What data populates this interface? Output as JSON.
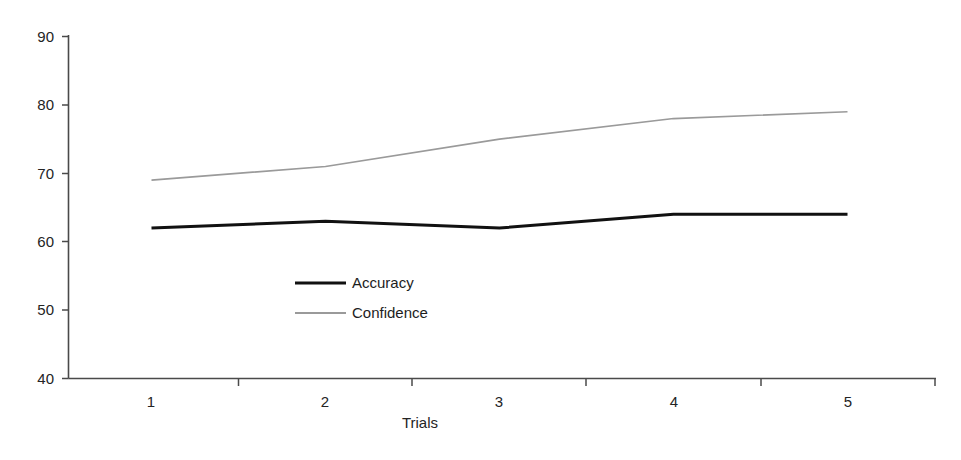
{
  "chart_data": {
    "type": "line",
    "title": "",
    "xlabel": "Trials",
    "ylabel": "",
    "categories": [
      "1",
      "2",
      "3",
      "4",
      "5"
    ],
    "x": [
      1,
      2,
      3,
      4,
      5
    ],
    "series": [
      {
        "name": "Accuracy",
        "values": [
          62,
          63,
          62,
          64,
          64
        ],
        "color": "#111111",
        "line_width": 3
      },
      {
        "name": "Confidence",
        "values": [
          69,
          71,
          75,
          78,
          79
        ],
        "color": "#9a9a9a",
        "line_width": 1.6
      }
    ],
    "ylim": [
      40,
      90
    ],
    "yticks": [
      40,
      50,
      60,
      70,
      80,
      90
    ],
    "ytick_labels": [
      "40",
      "50",
      "60",
      "70",
      "80",
      "90"
    ],
    "xtick_labels": [
      "1",
      "2",
      "3",
      "4",
      "5"
    ],
    "grid": false,
    "legend_position": "center-left-inside",
    "axis_color": "#4a4a4a",
    "background": "#ffffff"
  },
  "axes": {
    "y_labels": [
      "90",
      "80",
      "70",
      "60",
      "50",
      "40"
    ],
    "x_labels": [
      "1",
      "2",
      "3",
      "4",
      "5"
    ],
    "x_title": "Trials"
  },
  "legend": {
    "entries": [
      {
        "label": "Accuracy",
        "swatch": "line-swatch-black"
      },
      {
        "label": "Confidence",
        "swatch": "line-swatch-gray"
      }
    ]
  }
}
